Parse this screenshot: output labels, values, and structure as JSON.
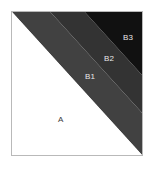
{
  "figure": {
    "width": 155,
    "height": 169,
    "background": "#ffffff",
    "frame": {
      "border_color": "#b9b9b9",
      "fill": "#ffffff"
    }
  },
  "chart_data": {
    "type": "diagram",
    "title": "",
    "subtitle": "",
    "xlabel": "",
    "ylabel": "",
    "grid": false,
    "legend": "none",
    "axis_ranges": {
      "x": [
        0,
        1
      ],
      "y": [
        0,
        1
      ]
    },
    "regions": [
      {
        "id": "A",
        "label": "A",
        "color": "#ffffff",
        "label_color": "#3a3a3a",
        "shape": "triangle",
        "polygon": [
          [
            0,
            0
          ],
          [
            1,
            1
          ],
          [
            0,
            1
          ]
        ],
        "label_xy": [
          0.38,
          0.74
        ]
      },
      {
        "id": "B1",
        "label": "B1",
        "color": "#414141",
        "label_color": "#e8e8e8",
        "shape": "band",
        "polygon": [
          [
            0,
            0
          ],
          [
            0.295,
            0
          ],
          [
            1,
            0.705
          ],
          [
            1,
            1
          ]
        ],
        "label_xy": [
          0.59,
          0.45
        ]
      },
      {
        "id": "B2",
        "label": "B2",
        "color": "#333333",
        "label_color": "#e8e8e8",
        "shape": "band",
        "polygon": [
          [
            0.295,
            0
          ],
          [
            0.56,
            0
          ],
          [
            1,
            0.44
          ],
          [
            1,
            0.705
          ]
        ],
        "label_xy": [
          0.735,
          0.32
        ]
      },
      {
        "id": "B3",
        "label": "B3",
        "color": "#111111",
        "label_color": "#e8e8e8",
        "shape": "band",
        "polygon": [
          [
            0.56,
            0
          ],
          [
            1,
            0
          ],
          [
            1,
            0.44
          ]
        ],
        "label_xy": [
          0.88,
          0.175
        ]
      }
    ],
    "boundaries": [
      {
        "name": "A-B1",
        "from": [
          0,
          0
        ],
        "to": [
          1,
          1
        ]
      },
      {
        "name": "B1-B2",
        "from": [
          0.295,
          0
        ],
        "to": [
          1,
          0.705
        ]
      },
      {
        "name": "B2-B3",
        "from": [
          0.56,
          0
        ],
        "to": [
          1,
          0.44
        ]
      }
    ]
  }
}
